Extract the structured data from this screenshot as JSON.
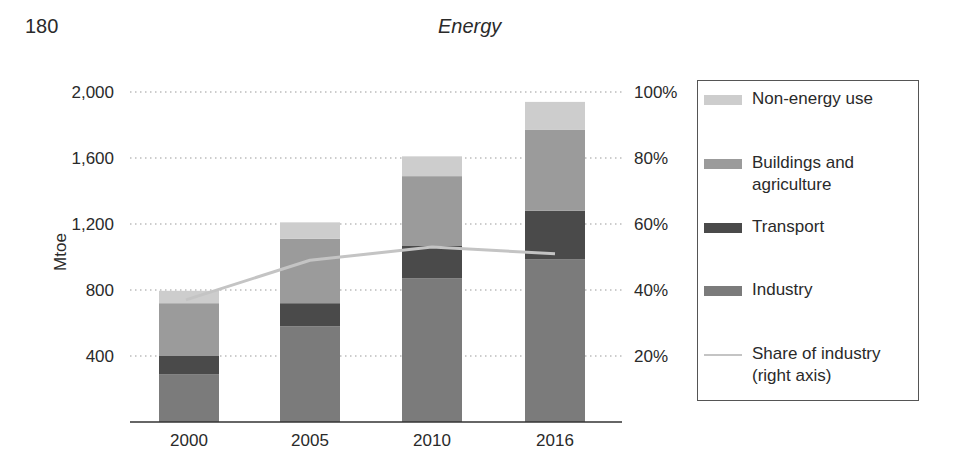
{
  "page": {
    "page_number": "180",
    "running_head": "Energy"
  },
  "colors": {
    "non_energy": "#cdcdcd",
    "buildings": "#9b9b9b",
    "transport": "#4a4a4a",
    "industry": "#7b7b7b",
    "share_line": "#c4c4c4",
    "grid": "#9a9a9a",
    "axis": "#333333"
  },
  "chart_data": {
    "type": "bar",
    "stacked": true,
    "title": "",
    "xlabel": "",
    "ylabel": "Mtoe",
    "ylabel_right": "",
    "categories": [
      "2000",
      "2005",
      "2010",
      "2016"
    ],
    "ylim": [
      0,
      2000
    ],
    "yticks": [
      400,
      800,
      1200,
      1600,
      2000
    ],
    "ytick_labels": [
      "400",
      "800",
      "1,200",
      "1,600",
      "2,000"
    ],
    "ylim_right": [
      0,
      100
    ],
    "yticks_right": [
      20,
      40,
      60,
      80,
      100
    ],
    "ytick_labels_right": [
      "20%",
      "40%",
      "60%",
      "80%",
      "100%"
    ],
    "grid": "horizontal dotted",
    "legend_position": "right",
    "series": [
      {
        "name": "Industry",
        "key": "industry",
        "kind": "bar",
        "values": [
          290,
          580,
          870,
          985
        ]
      },
      {
        "name": "Transport",
        "key": "transport",
        "kind": "bar",
        "values": [
          110,
          140,
          200,
          295
        ]
      },
      {
        "name": "Buildings and agriculture",
        "key": "buildings",
        "kind": "bar",
        "values": [
          320,
          390,
          420,
          490
        ]
      },
      {
        "name": "Non-energy use",
        "key": "non_energy",
        "kind": "bar",
        "values": [
          75,
          100,
          120,
          170
        ]
      },
      {
        "name": "Share of industry (right axis)",
        "key": "share_line",
        "kind": "line",
        "axis": "right",
        "values": [
          37,
          49,
          53,
          51
        ]
      }
    ]
  },
  "legend": {
    "items": [
      {
        "label": "Non-energy use",
        "key": "non_energy",
        "type": "swatch"
      },
      {
        "label": "Buildings and agriculture",
        "key": "buildings",
        "type": "swatch"
      },
      {
        "label": "Transport",
        "key": "transport",
        "type": "swatch"
      },
      {
        "label": "Industry",
        "key": "industry",
        "type": "swatch"
      },
      {
        "label": "Share of industry (right axis)",
        "key": "share_line",
        "type": "line"
      }
    ]
  }
}
